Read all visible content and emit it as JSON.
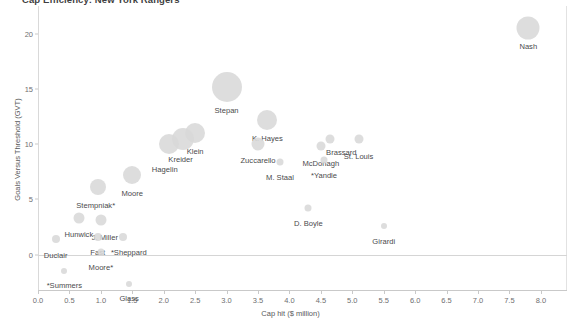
{
  "chart_data": {
    "type": "scatter",
    "title": "Cap Efficiency: New York Rangers",
    "xlabel": "Cap hit ($ million)",
    "ylabel": "Goals Versus Threshold (GVT)",
    "xlim": [
      0.0,
      8.4
    ],
    "ylim": [
      -3.2,
      22.5
    ],
    "xticks": [
      "0.0",
      "0.5",
      "1.0",
      "1.5",
      "2.0",
      "2.5",
      "3.0",
      "3.5",
      "4.0",
      "4.5",
      "5.0",
      "5.5",
      "6.0",
      "6.5",
      "7.0",
      "7.5",
      "8.0"
    ],
    "xtick_values": [
      0.0,
      0.5,
      1.0,
      1.5,
      2.0,
      2.5,
      3.0,
      3.5,
      4.0,
      4.5,
      5.0,
      5.5,
      6.0,
      6.5,
      7.0,
      7.5,
      8.0
    ],
    "yticks": [
      "0",
      "5",
      "10",
      "15",
      "20"
    ],
    "ytick_values": [
      0,
      5,
      10,
      15,
      20
    ],
    "grid": false,
    "legend": "none",
    "marker_color": "#d8d8d8",
    "zero_reference_line": 0,
    "points": [
      {
        "label": "Nash",
        "x": 7.8,
        "y": 20.5,
        "size": 23,
        "label_dx": 0,
        "label_dy": 14
      },
      {
        "label": "Stepan",
        "x": 3.0,
        "y": 15.2,
        "size": 30,
        "label_dx": 0,
        "label_dy": 19
      },
      {
        "label": "K. Hayes",
        "x": 3.65,
        "y": 12.2,
        "size": 20,
        "label_dx": 0,
        "label_dy": 14
      },
      {
        "label": "Klein",
        "x": 2.5,
        "y": 11.0,
        "size": 20,
        "label_dx": 0,
        "label_dy": 14
      },
      {
        "label": "Kreider",
        "x": 2.3,
        "y": 10.5,
        "size": 22,
        "label_dx": -2,
        "label_dy": 16
      },
      {
        "label": "Hagelin",
        "x": 2.08,
        "y": 10.0,
        "size": 20,
        "label_dx": -4,
        "label_dy": 21
      },
      {
        "label": "Zuccarello",
        "x": 3.5,
        "y": 10.0,
        "size": 13,
        "label_dx": 0,
        "label_dy": 12
      },
      {
        "label": "Brassard",
        "x": 4.65,
        "y": 10.5,
        "size": 9,
        "label_dx": 11,
        "label_dy": 9
      },
      {
        "label": "St. Louis",
        "x": 5.1,
        "y": 10.5,
        "size": 9,
        "label_dx": 0,
        "label_dy": 13
      },
      {
        "label": "McDonagh",
        "x": 4.5,
        "y": 9.8,
        "size": 9,
        "label_dx": 0,
        "label_dy": 13
      },
      {
        "label": "*Yandle",
        "x": 4.55,
        "y": 8.6,
        "size": 7,
        "label_dx": 0,
        "label_dy": 11
      },
      {
        "label": "M. Staal",
        "x": 3.85,
        "y": 8.4,
        "size": 7,
        "label_dx": 0,
        "label_dy": 11
      },
      {
        "label": "Moore",
        "x": 1.5,
        "y": 7.2,
        "size": 18,
        "label_dx": 0,
        "label_dy": 14
      },
      {
        "label": "Stempniak*",
        "x": 0.95,
        "y": 6.1,
        "size": 16,
        "label_dx": -2,
        "label_dy": 14
      },
      {
        "label": "D. Boyle",
        "x": 4.3,
        "y": 4.2,
        "size": 7,
        "label_dx": 0,
        "label_dy": 11
      },
      {
        "label": "Girardi",
        "x": 5.5,
        "y": 2.6,
        "size": 6,
        "label_dx": 0,
        "label_dy": 11
      },
      {
        "label": "Hunwick",
        "x": 0.65,
        "y": 3.3,
        "size": 11,
        "label_dx": 0,
        "label_dy": 12
      },
      {
        "label": "J. Miller",
        "x": 1.0,
        "y": 3.1,
        "size": 11,
        "label_dx": 4,
        "label_dy": 13
      },
      {
        "label": "Fast",
        "x": 0.95,
        "y": 1.6,
        "size": 8,
        "label_dx": 0,
        "label_dy": 11
      },
      {
        "label": "*Sheppard",
        "x": 1.35,
        "y": 1.6,
        "size": 8,
        "label_dx": 6,
        "label_dy": 11
      },
      {
        "label": "Duclair",
        "x": 0.28,
        "y": 1.4,
        "size": 8,
        "label_dx": 0,
        "label_dy": 12
      },
      {
        "label": "Moore*",
        "x": 1.0,
        "y": 0.2,
        "size": 7,
        "label_dx": 0,
        "label_dy": 11
      },
      {
        "label": "*Summers",
        "x": 0.42,
        "y": -1.5,
        "size": 6,
        "label_dx": 0,
        "label_dy": 10
      },
      {
        "label": "Glass",
        "x": 1.45,
        "y": -2.7,
        "size": 6,
        "label_dx": 0,
        "label_dy": 10
      }
    ]
  }
}
